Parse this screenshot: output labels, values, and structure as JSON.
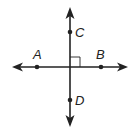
{
  "diagram": {
    "color": "#222222",
    "lines": [
      {
        "name": "line-AB",
        "through": [
          "A",
          "B"
        ],
        "orientation": "horizontal",
        "arrows": "both"
      },
      {
        "name": "line-CD",
        "through": [
          "C",
          "D"
        ],
        "orientation": "vertical",
        "arrows": "both"
      }
    ],
    "points": [
      {
        "label": "A"
      },
      {
        "label": "B"
      },
      {
        "label": "C"
      },
      {
        "label": "D"
      }
    ],
    "right_angle_mark": true
  }
}
